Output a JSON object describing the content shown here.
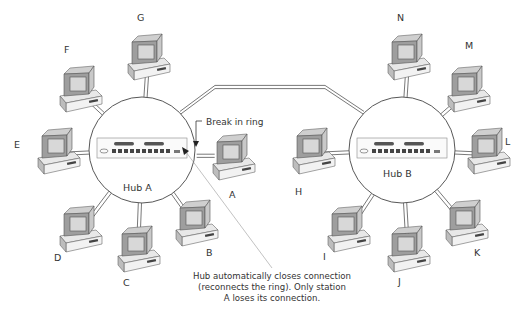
{
  "diagram": {
    "type": "token-ring-hub-topology",
    "hubs": [
      {
        "id": "hub-a",
        "label": "Hub A",
        "cx": 142,
        "cy": 150,
        "r": 53
      },
      {
        "id": "hub-b",
        "label": "Hub B",
        "cx": 402,
        "cy": 150,
        "r": 53
      }
    ],
    "stations": [
      {
        "label": "G",
        "hub": "hub-a",
        "x": 130,
        "y": 40,
        "lx": 137,
        "ly": 13
      },
      {
        "label": "F",
        "hub": "hub-a",
        "x": 62,
        "y": 72,
        "lx": 64,
        "ly": 45
      },
      {
        "label": "E",
        "hub": "hub-a",
        "x": 40,
        "y": 134,
        "lx": 14,
        "ly": 140
      },
      {
        "label": "D",
        "hub": "hub-a",
        "x": 62,
        "y": 212,
        "lx": 54,
        "ly": 253
      },
      {
        "label": "C",
        "hub": "hub-a",
        "x": 120,
        "y": 232,
        "lx": 123,
        "ly": 278
      },
      {
        "label": "B",
        "hub": "hub-a",
        "x": 178,
        "y": 206,
        "lx": 206,
        "ly": 248
      },
      {
        "label": "A",
        "hub": "hub-a",
        "x": 215,
        "y": 140,
        "lx": 229,
        "ly": 190
      },
      {
        "label": "N",
        "hub": "hub-b",
        "x": 390,
        "y": 40,
        "lx": 397,
        "ly": 13
      },
      {
        "label": "M",
        "hub": "hub-b",
        "x": 450,
        "y": 72,
        "lx": 465,
        "ly": 41
      },
      {
        "label": "L",
        "hub": "hub-b",
        "x": 470,
        "y": 134,
        "lx": 505,
        "ly": 137
      },
      {
        "label": "H",
        "hub": "hub-b",
        "x": 295,
        "y": 134,
        "lx": 295,
        "ly": 187
      },
      {
        "label": "I",
        "hub": "hub-b",
        "x": 330,
        "y": 212,
        "lx": 323,
        "ly": 252
      },
      {
        "label": "J",
        "hub": "hub-b",
        "x": 390,
        "y": 232,
        "lx": 398,
        "ly": 277
      },
      {
        "label": "K",
        "hub": "hub-b",
        "x": 448,
        "y": 206,
        "lx": 474,
        "ly": 248
      }
    ],
    "ring_link": {
      "from": "hub-a",
      "to": "hub-b"
    },
    "annotations": {
      "break_label": "Break in ring",
      "callout_lines": [
        "Hub automatically closes connection",
        "(reconnects the ring). Only station",
        "A loses its connection."
      ]
    }
  },
  "colors": {
    "line": "#555555",
    "hub_outline": "#444444",
    "screen": "#d8d8d8",
    "case_light": "#e8e8e8",
    "case_dark": "#9a9a9a",
    "text": "#333333"
  }
}
